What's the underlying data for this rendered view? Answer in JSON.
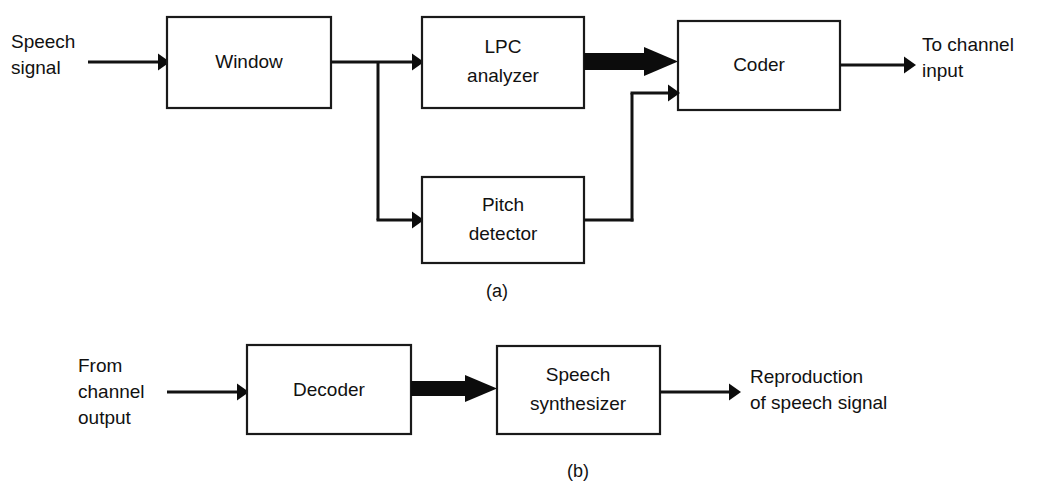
{
  "figure": {
    "background": "#ffffff",
    "ink_color": "#111111",
    "panels": [
      {
        "id": "a",
        "caption": "(a)",
        "blocks": [
          {
            "id": "window",
            "label": "Window"
          },
          {
            "id": "lpc-analyzer",
            "label_line1": "LPC",
            "label_line2": "analyzer"
          },
          {
            "id": "coder",
            "label": "Coder"
          },
          {
            "id": "pitch-detector",
            "label_line1": "Pitch",
            "label_line2": "detector"
          }
        ],
        "io_labels": [
          {
            "id": "speech-signal-input",
            "line1": "Speech",
            "line2": "signal"
          },
          {
            "id": "to-channel-input",
            "line1": "To channel",
            "line2": "input"
          }
        ]
      },
      {
        "id": "b",
        "caption": "(b)",
        "blocks": [
          {
            "id": "decoder",
            "label": "Decoder"
          },
          {
            "id": "speech-synthesizer",
            "label_line1": "Speech",
            "label_line2": "synthesizer"
          }
        ],
        "io_labels": [
          {
            "id": "from-channel-output",
            "line1": "From",
            "line2": "channel",
            "line3": "output"
          },
          {
            "id": "reproduction-output",
            "line1": "Reproduction",
            "line2": "of speech signal"
          }
        ]
      }
    ]
  }
}
